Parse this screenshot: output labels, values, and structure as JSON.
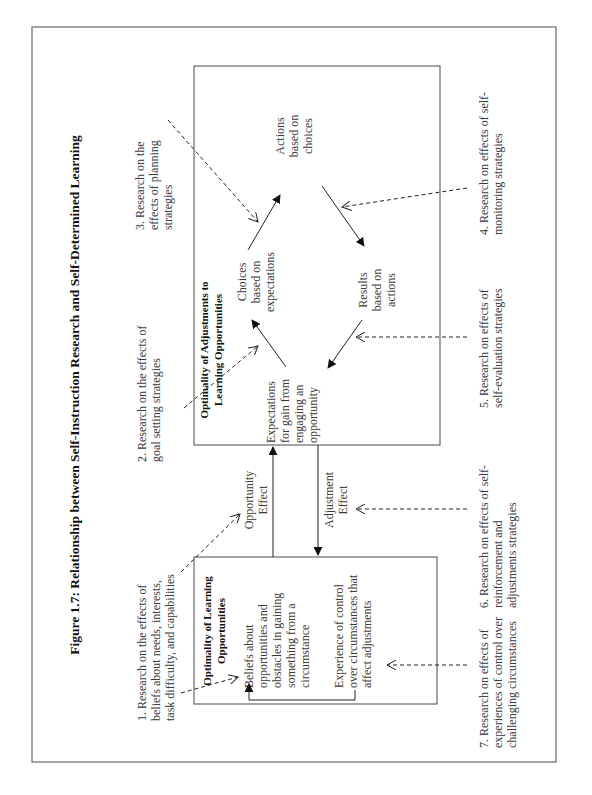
{
  "figure": {
    "title": "Figure 1.7: Relationship between Self-Instruction Research and Self-Determined Learning",
    "orientation": "rotated 90° counter-clockwise"
  },
  "upper_box": {
    "title_lines": [
      "Optimality of Adjustments to",
      "Learning Opportunities"
    ],
    "nodes": {
      "expectations": [
        "Expectations",
        "for gain from",
        "engaging an",
        "opportunity"
      ],
      "choices": [
        "Choices",
        "based on",
        "expectations"
      ],
      "actions": [
        "Actions",
        "based on",
        "choices"
      ],
      "results": [
        "Results",
        "based on",
        "actions"
      ]
    }
  },
  "lower_box": {
    "title_lines": [
      "Optimality of Learning",
      "Opportunities"
    ],
    "beliefs": [
      "Beliefs about",
      "opportunities and",
      "obstacles in gaining",
      "something from a",
      "circumstance"
    ],
    "experience": [
      "Experience of control",
      "over circumstances that",
      "affect adjustments"
    ]
  },
  "connectors": {
    "opportunity_effect": [
      "Opportunity",
      "Effect"
    ],
    "adjustment_effect": [
      "Adjustment",
      "Effect"
    ]
  },
  "research_notes": [
    {
      "id": 1,
      "lines": [
        "1. Research on the effects of",
        "beliefs about needs, interests,",
        "task difficulty, and capabilities"
      ]
    },
    {
      "id": 2,
      "lines": [
        "2. Research on the effects of",
        "goal setting strategies"
      ]
    },
    {
      "id": 3,
      "lines": [
        "3. Research on the",
        "effects of planning",
        "strategies"
      ]
    },
    {
      "id": 4,
      "lines": [
        "4. Research on effects of self-",
        "monitoring strategies"
      ]
    },
    {
      "id": 5,
      "lines": [
        "5. Research on effects of",
        "self-evaluation strategies"
      ]
    },
    {
      "id": 6,
      "lines": [
        "6. Research on effects of self-",
        "reinforcement and",
        "adjustments strategies"
      ]
    },
    {
      "id": 7,
      "lines": [
        "7. Research on effects of",
        "experiences of control over",
        "challenging circumstances"
      ]
    }
  ]
}
